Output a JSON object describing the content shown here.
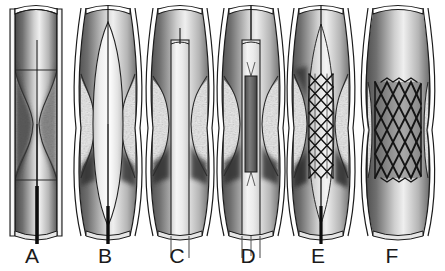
{
  "figure": {
    "background_color": "#ffffff",
    "width": 445,
    "height": 271,
    "panel_count": 6
  },
  "colors": {
    "vessel_wall_outline": "#1c1c1c",
    "vessel_wall_fill": "#ffffff",
    "lumen_dark": "#3b3b3b",
    "lumen_mid": "#8c8c8c",
    "lumen_light": "#f2f2f2",
    "plaque_fill": "#e8e8e8",
    "plaque_outline": "#2a2a2a",
    "guidewire": "#0d0d0d",
    "balloon_fill": "#f5f5f5",
    "stent_strut": "#141414",
    "label_text": "#1a1a1a"
  },
  "panels": [
    {
      "id": "A",
      "label": "A",
      "label_x": 32,
      "label_y": 248,
      "center_x": 36,
      "stage_name": "guidewire-crossing-lesion",
      "has_guidewire": true,
      "has_balloon": false,
      "has_sheath": false,
      "has_stent": false,
      "stenosis": "severe",
      "wall_shape": "straight",
      "lumen_waist_width": 6
    },
    {
      "id": "B",
      "label": "B",
      "label_x": 105,
      "label_y": 248,
      "center_x": 108,
      "stage_name": "balloon-predilatation-inflated",
      "has_guidewire": true,
      "has_balloon": true,
      "has_sheath": false,
      "has_stent": false,
      "stenosis": "dilated",
      "wall_shape": "bulged",
      "lumen_waist_width": 30
    },
    {
      "id": "C",
      "label": "C",
      "label_x": 177,
      "label_y": 248,
      "center_x": 180,
      "stage_name": "delivery-sheath-advanced",
      "has_guidewire": true,
      "has_balloon": false,
      "has_sheath": true,
      "has_stent": false,
      "stenosis": "moderate",
      "wall_shape": "bulged",
      "lumen_waist_width": 22
    },
    {
      "id": "D",
      "label": "D",
      "label_x": 248,
      "label_y": 248,
      "center_x": 251,
      "stage_name": "crimped-stent-positioned-in-sheath",
      "has_guidewire": true,
      "has_balloon": false,
      "has_sheath": true,
      "has_stent": true,
      "stent_state": "crimped",
      "stenosis": "moderate",
      "wall_shape": "bulged",
      "lumen_waist_width": 22
    },
    {
      "id": "E",
      "label": "E",
      "label_x": 318,
      "label_y": 248,
      "center_x": 321,
      "stage_name": "stent-partially-expanded",
      "has_guidewire": true,
      "has_balloon": false,
      "has_sheath": false,
      "has_stent": true,
      "stent_state": "partially-expanded",
      "stenosis": "residual",
      "wall_shape": "bulged",
      "lumen_waist_width": 28
    },
    {
      "id": "F",
      "label": "F",
      "label_x": 392,
      "label_y": 248,
      "center_x": 398,
      "stage_name": "stent-fully-deployed",
      "has_guidewire": false,
      "has_balloon": false,
      "has_sheath": false,
      "has_stent": true,
      "stent_state": "fully-expanded",
      "stenosis": "relieved",
      "wall_shape": "bulged",
      "lumen_waist_width": 46
    }
  ]
}
